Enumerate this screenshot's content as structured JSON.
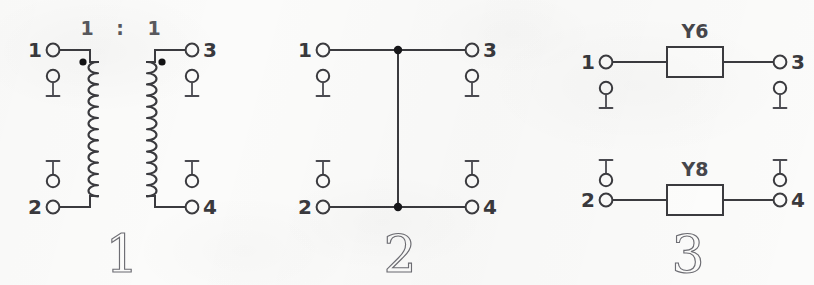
{
  "figure": {
    "background_color": "#fbfbfa",
    "line_color": "#3b3b3f",
    "width": 814,
    "height": 285
  },
  "diagrams": [
    {
      "id": "diagram-1",
      "caption": "1",
      "type": "transformer",
      "ratio_label_left": "1",
      "ratio_separator": ":",
      "ratio_label_right": "1",
      "pins": [
        {
          "id": "pin-1",
          "label": "1",
          "corner": "top-left"
        },
        {
          "id": "pin-2",
          "label": "2",
          "corner": "bottom-left"
        },
        {
          "id": "pin-3",
          "label": "3",
          "corner": "top-right"
        },
        {
          "id": "pin-4",
          "label": "4",
          "corner": "bottom-right"
        }
      ],
      "polarity_dots": 2,
      "coil_turns": 12,
      "test_points": 4
    },
    {
      "id": "diagram-2",
      "caption": "2",
      "type": "through-connection",
      "pins": [
        {
          "id": "pin-1",
          "label": "1",
          "corner": "top-left"
        },
        {
          "id": "pin-2",
          "label": "2",
          "corner": "bottom-left"
        },
        {
          "id": "pin-3",
          "label": "3",
          "corner": "top-right"
        },
        {
          "id": "pin-4",
          "label": "4",
          "corner": "bottom-right"
        }
      ],
      "junction_dots": 2,
      "test_points": 4
    },
    {
      "id": "diagram-3",
      "caption": "3",
      "type": "admittance-blocks",
      "components": [
        {
          "id": "component-y6",
          "label": "Y6",
          "between": "1-3"
        },
        {
          "id": "component-y8",
          "label": "Y8",
          "between": "2-4"
        }
      ],
      "pins": [
        {
          "id": "pin-1",
          "label": "1",
          "corner": "top-left"
        },
        {
          "id": "pin-2",
          "label": "2",
          "corner": "bottom-left"
        },
        {
          "id": "pin-3",
          "label": "3",
          "corner": "top-right"
        },
        {
          "id": "pin-4",
          "label": "4",
          "corner": "bottom-right"
        }
      ],
      "test_points": 4
    }
  ]
}
